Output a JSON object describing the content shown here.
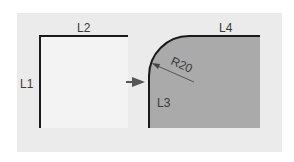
{
  "diagram": {
    "colors": {
      "panel": "#ebebeb",
      "left_fill": "#f2f2f2",
      "right_fill": "#a9a9a9",
      "edge": "#1a1a1a",
      "arrow": "#555555",
      "text": "#3a3a3a"
    },
    "left_shape": {
      "labels": {
        "left_edge": "L1",
        "top_edge": "L2"
      }
    },
    "arrow": {
      "direction": "right"
    },
    "right_shape": {
      "labels": {
        "left_edge": "L3",
        "top_edge": "L4",
        "fillet_radius": "R20"
      }
    }
  }
}
